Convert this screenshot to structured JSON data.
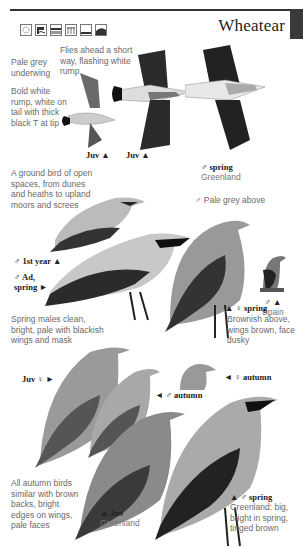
{
  "page": {
    "title": "Wheatear",
    "habitat_icons": [
      "heath-icon",
      "coast-icon",
      "wetland-icon",
      "farmland-icon",
      "grassland-icon",
      "mountain-icon"
    ]
  },
  "notes": {
    "flight": "Flies ahead a short way, flashing white rump",
    "underwing": "Pale grey underwing",
    "rump": "Bold white rump, white on tail with thick black T at tip",
    "habitat": "A ground bird of open spaces, from dunes and heaths to upland moors and screes",
    "pale_grey_above": "♂ Pale grey above",
    "spring_males": "Spring males clean, bright, pale with blackish wings and mask",
    "autumn_birds": "All autumn birds similar with brown backs, bright edges on wings, pale faces"
  },
  "labels": {
    "juv1": "Juv ▲",
    "juv2": "Juv ▲",
    "male_spring_greenland": {
      "main": "♂ spring",
      "sub": "Greenland",
      "arrow": "▲"
    },
    "male_1st_year": "♂ 1st year ▲",
    "male_ad_spring_1": "♂ Ad,",
    "male_ad_spring_2": "spring ►",
    "male_spain": {
      "main": "♂ ▲",
      "sub": "Spain"
    },
    "female_spring": {
      "main": "▲ ♀ spring",
      "sub": "Brownish above, wings brown, face dusky"
    },
    "juv_female": "Juv ♀ ►",
    "female_autumn": "◄ ♀ autumn",
    "male_autumn": "◄ ♂ autumn",
    "juv_greenland": {
      "main": "▲ Juv",
      "sub": "Greenland"
    },
    "male_spring_greenland2": {
      "main": "▲ ♂ spring",
      "sub": "Greenland: big, bright in spring, tinged brown"
    }
  }
}
